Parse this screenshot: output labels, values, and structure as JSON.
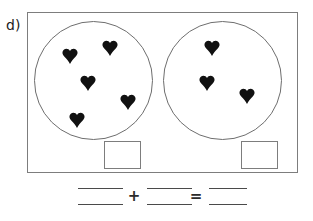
{
  "problem": {
    "part_label": "d)",
    "type": "addition-grouping-worksheet"
  },
  "groups": [
    {
      "name": "left-group",
      "object_icon": "heart-icon",
      "count": 5,
      "hearts": [
        {
          "x": 70,
          "y": 56
        },
        {
          "x": 110,
          "y": 48
        },
        {
          "x": 88,
          "y": 83
        },
        {
          "x": 128,
          "y": 102
        },
        {
          "x": 77,
          "y": 120
        }
      ],
      "answer_box_value": ""
    },
    {
      "name": "right-group",
      "object_icon": "heart-icon",
      "count": 3,
      "hearts": [
        {
          "x": 212,
          "y": 48
        },
        {
          "x": 207,
          "y": 83
        },
        {
          "x": 247,
          "y": 96
        }
      ],
      "answer_box_value": ""
    }
  ],
  "equation": {
    "addend_1": "",
    "operator_plus": "+",
    "addend_2": "",
    "operator_equals": "=",
    "sum": ""
  },
  "colors": {
    "ink": "#1c1c1c",
    "outline": "#7d7d7d",
    "circle_outline": "#6e6e6e",
    "rule": "#4a4a4a",
    "heart_fill": "#111111",
    "background": "#ffffff"
  }
}
